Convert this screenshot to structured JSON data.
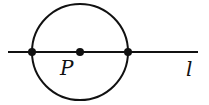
{
  "diagram": {
    "circle": {
      "cx": 80,
      "cy": 52,
      "r": 48
    },
    "line": {
      "x1": 8,
      "y1": 52,
      "x2": 198,
      "y2": 52,
      "label": "l"
    },
    "points": [
      {
        "name": "left-intersection",
        "x": 32,
        "y": 52
      },
      {
        "name": "center-P",
        "x": 80,
        "y": 52,
        "label": "P"
      },
      {
        "name": "right-intersection",
        "x": 128,
        "y": 52
      }
    ],
    "labels": {
      "center": "P",
      "line": "l"
    },
    "stroke_color": "#111111"
  }
}
